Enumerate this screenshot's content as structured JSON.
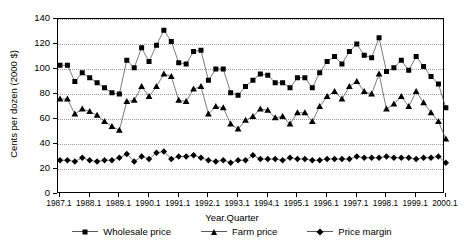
{
  "chart_data": {
    "type": "line",
    "title": "",
    "xlabel": "Year.Quarter",
    "ylabel": "Cents per dozen (2000 $)",
    "ylim": [
      0,
      140
    ],
    "ytick_values": [
      0,
      20,
      40,
      60,
      80,
      100,
      120,
      140
    ],
    "ytick_labels": [
      "0",
      "20",
      "40",
      "60",
      "80",
      "100",
      "120",
      "140"
    ],
    "grid": true,
    "grid_axis": "y",
    "legend_position": "bottom",
    "xtick_labels": [
      "1987.1",
      "1988.1",
      "1989.1",
      "1990.1",
      "1991.1",
      "1992.1",
      "1993.1",
      "1994.1",
      "1995.1",
      "1996.1",
      "1997.1",
      "1998.1",
      "1999.1",
      "2000.1"
    ],
    "x": [
      "1987.1",
      "1987.2",
      "1987.3",
      "1987.4",
      "1988.1",
      "1988.2",
      "1988.3",
      "1988.4",
      "1989.1",
      "1989.2",
      "1989.3",
      "1989.4",
      "1990.1",
      "1990.2",
      "1990.3",
      "1990.4",
      "1991.1",
      "1991.2",
      "1991.3",
      "1991.4",
      "1992.1",
      "1992.2",
      "1992.3",
      "1992.4",
      "1993.1",
      "1993.2",
      "1993.3",
      "1993.4",
      "1994.1",
      "1994.2",
      "1994.3",
      "1994.4",
      "1995.1",
      "1995.2",
      "1995.3",
      "1995.4",
      "1996.1",
      "1996.2",
      "1996.3",
      "1996.4",
      "1997.1",
      "1997.2",
      "1997.3",
      "1997.4",
      "1998.1",
      "1998.2",
      "1998.3",
      "1998.4",
      "1999.1",
      "1999.2",
      "1999.3",
      "1999.4",
      "2000.1"
    ],
    "series": [
      {
        "name": "Wholesale price",
        "marker": "square",
        "values": [
          103,
          103,
          90,
          97,
          93,
          89,
          85,
          81,
          80,
          107,
          101,
          117,
          106,
          119,
          131,
          122,
          105,
          104,
          114,
          115,
          91,
          100,
          100,
          81,
          79,
          86,
          91,
          96,
          95,
          89,
          89,
          85,
          93,
          93,
          85,
          97,
          106,
          110,
          104,
          114,
          120,
          111,
          109,
          125,
          98,
          101,
          107,
          99,
          110,
          102,
          94,
          88,
          69
        ]
      },
      {
        "name": "Farm price",
        "marker": "triangle",
        "values": [
          76,
          76,
          64,
          68,
          66,
          63,
          58,
          54,
          51,
          74,
          75,
          86,
          78,
          86,
          96,
          94,
          75,
          74,
          84,
          86,
          64,
          70,
          69,
          56,
          52,
          59,
          62,
          68,
          67,
          61,
          62,
          56,
          65,
          65,
          58,
          70,
          78,
          82,
          76,
          86,
          90,
          82,
          80,
          96,
          68,
          72,
          78,
          70,
          82,
          73,
          65,
          58,
          44
        ]
      },
      {
        "name": "Price margin",
        "marker": "diamond",
        "values": [
          27,
          27,
          26,
          29,
          27,
          26,
          27,
          27,
          29,
          32,
          26,
          30,
          28,
          33,
          34,
          28,
          30,
          30,
          31,
          29,
          27,
          26,
          27,
          25,
          27,
          27,
          31,
          28,
          28,
          28,
          27,
          29,
          28,
          28,
          27,
          27,
          28,
          28,
          28,
          28,
          30,
          29,
          29,
          29,
          30,
          29,
          29,
          29,
          28,
          29,
          29,
          30,
          25
        ]
      }
    ]
  },
  "legend": {
    "items": [
      {
        "label": "Wholesale price",
        "marker": "square"
      },
      {
        "label": "Farm price",
        "marker": "triangle"
      },
      {
        "label": "Price margin",
        "marker": "diamond"
      }
    ]
  },
  "colors": {
    "series": "#000000",
    "grid": "#9a9a9a",
    "axis": "#000000",
    "line": "#5a5a5a",
    "background": "#ffffff"
  }
}
